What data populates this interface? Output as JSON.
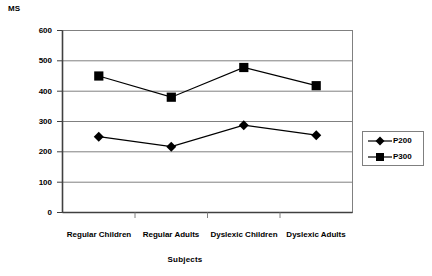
{
  "chart_data": {
    "type": "line",
    "title": "",
    "xlabel": "Subjects",
    "ylabel": "MS",
    "categories": [
      "Regular Children",
      "Regular Adults",
      "Dyslexic Children",
      "Dyslexic Adults"
    ],
    "series": [
      {
        "name": "P200",
        "marker": "diamond",
        "color": "#000000",
        "values": [
          250,
          217,
          288,
          255
        ]
      },
      {
        "name": "P300",
        "marker": "square",
        "color": "#000000",
        "values": [
          450,
          380,
          478,
          418
        ]
      }
    ],
    "ylim": [
      0,
      600
    ],
    "ytick_labels": [
      "600",
      "500",
      "400",
      "300",
      "200",
      "100",
      "0"
    ],
    "ytick_values": [
      600,
      500,
      400,
      300,
      200,
      100,
      0
    ],
    "ystep": 100,
    "grid": "horizontal",
    "legend_position": "right",
    "plot_border_color": "#808080",
    "gridline_color": "#808080"
  },
  "legend": {
    "entries": [
      {
        "label": "P200"
      },
      {
        "label": "P300"
      }
    ]
  }
}
